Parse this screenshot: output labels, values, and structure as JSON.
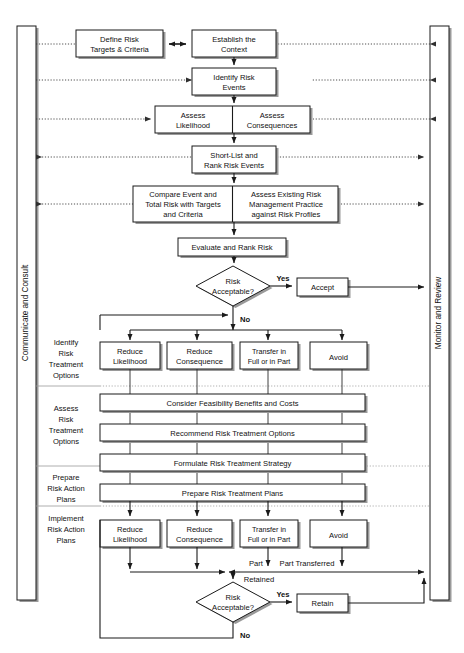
{
  "diagram": {
    "side_bars": {
      "left": {
        "label": "Communicate and Consult"
      },
      "right": {
        "label": "Monitor and Review"
      }
    },
    "stage_labels": [
      {
        "id": "identify-options",
        "lines": [
          "Identify",
          "Risk",
          "Treatment",
          "Options"
        ]
      },
      {
        "id": "assess-options",
        "lines": [
          "Assess",
          "Risk",
          "Treatment",
          "Options"
        ]
      },
      {
        "id": "prepare-plans",
        "lines": [
          "Prepare",
          "Risk Action",
          "Plans"
        ]
      },
      {
        "id": "implement-plans",
        "lines": [
          "Implement",
          "Risk Action",
          "Plans"
        ]
      }
    ],
    "nodes": {
      "define_risk_targets": {
        "lines": [
          "Define Risk",
          "Targets & Criteria"
        ]
      },
      "establish_context": {
        "lines": [
          "Establish the",
          "Context"
        ]
      },
      "identify_risk_events": {
        "lines": [
          "Identify Risk",
          "Events"
        ]
      },
      "assess_likelihood": {
        "lines": [
          "Assess",
          "Likelihood"
        ]
      },
      "assess_consequences": {
        "lines": [
          "Assess",
          "Consequences"
        ]
      },
      "short_list": {
        "lines": [
          "Short-List and",
          "Rank Risk Events"
        ]
      },
      "compare_event": {
        "lines": [
          "Compare Event and",
          "Total Risk with Targets",
          "and Criteria"
        ]
      },
      "assess_existing": {
        "lines": [
          "Assess Existing Risk",
          "Management Practice",
          "against Risk Profiles"
        ]
      },
      "evaluate_rank": {
        "lines": [
          "Evaluate and Rank Risk"
        ]
      },
      "risk_acceptable_1": {
        "lines": [
          "Risk",
          "Acceptable?"
        ]
      },
      "accept": {
        "lines": [
          "Accept"
        ]
      },
      "reduce_likelihood_1": {
        "lines": [
          "Reduce",
          "Likelihood"
        ]
      },
      "reduce_consequence_1": {
        "lines": [
          "Reduce",
          "Consequence"
        ]
      },
      "transfer_1": {
        "lines": [
          "Transfer in",
          "Full or in Part"
        ]
      },
      "avoid_1": {
        "lines": [
          "Avoid"
        ]
      },
      "consider_feasibility": {
        "lines": [
          "Consider Feasibility Benefits and Costs"
        ]
      },
      "recommend_options": {
        "lines": [
          "Recommend Risk Treatment Options"
        ]
      },
      "formulate_strategy": {
        "lines": [
          "Formulate Risk Treatment Strategy"
        ]
      },
      "prepare_plans": {
        "lines": [
          "Prepare Risk Treatment Plans"
        ]
      },
      "reduce_likelihood_2": {
        "lines": [
          "Reduce",
          "Likelihood"
        ]
      },
      "reduce_consequence_2": {
        "lines": [
          "Reduce",
          "Consequence"
        ]
      },
      "transfer_2": {
        "lines": [
          "Transfer in",
          "Full or in Part"
        ]
      },
      "avoid_2": {
        "lines": [
          "Avoid"
        ]
      },
      "risk_acceptable_2": {
        "lines": [
          "Risk",
          "Acceptable?"
        ]
      },
      "retain": {
        "lines": [
          "Retain"
        ]
      }
    },
    "edge_labels": {
      "yes_1": "Yes",
      "no_1": "No",
      "yes_2": "Yes",
      "no_2": "No",
      "part_retained_a": "Part",
      "part_retained_b": "Retained",
      "part_transferred": "Part Transferred"
    },
    "colors": {
      "stroke": "#1a1a1a",
      "shadow": "#9a9a9a",
      "separator": "#9b9b9b",
      "background": "#ffffff",
      "text": "#111111"
    }
  }
}
